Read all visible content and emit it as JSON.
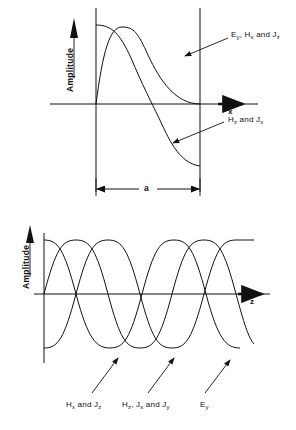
{
  "figure": {
    "background": "#ffffff",
    "stroke": "#111111"
  },
  "panels": [
    {
      "id": "transverse",
      "axis_y_label": "Amplitude",
      "axis_x_label": "x",
      "dimension_label": "a",
      "annotations": [
        {
          "id": "ann-ey",
          "text_html": "E<sub>y</sub>, H<sub>x</sub> and J<sub>z</sub>",
          "text": "Ey, Hx and Jz"
        },
        {
          "id": "ann-hz",
          "text_html": "H<sub>z</sub> and J<sub>x</sub>",
          "text": "Hz and Jx"
        }
      ]
    },
    {
      "id": "longitudinal",
      "axis_y_label": "Amplitude",
      "axis_x_label": "z",
      "annotations": [
        {
          "id": "ann-hx-jz",
          "text_html": "H<sub>x</sub> and J<sub>z</sub>",
          "text": "Hx and Jz"
        },
        {
          "id": "ann-hz-jx-jy",
          "text_html": "H<sub>z</sub>, J<sub>x</sub> and J<sub>y</sub>",
          "text": "Hz, Jx and Jy"
        },
        {
          "id": "ann-ey2",
          "text_html": "E<sub>y</sub>",
          "text": "Ey"
        }
      ]
    }
  ],
  "chart_data": [
    {
      "type": "line",
      "id": "transverse",
      "title": "",
      "xlabel": "x",
      "ylabel": "Amplitude",
      "xlim": [
        0,
        1
      ],
      "ylim": [
        -1.05,
        1.05
      ],
      "grid": false,
      "legend": "leader-lines",
      "annotations": [
        "Ey, Hx and Jz",
        "Hz and Jx",
        "a"
      ],
      "notes": "Transverse field variation of TE10 mode across guide width a. Walls drawn as vertical lines at x=0 and x=a. Dimension arrow labeled a below.",
      "series": [
        {
          "name": "Ey, Hx and Jz",
          "form": "sin(pi*x/a)",
          "x": [
            0,
            0.05,
            0.1,
            0.15,
            0.2,
            0.25,
            0.3,
            0.35,
            0.4,
            0.45,
            0.5,
            0.55,
            0.6,
            0.65,
            0.7,
            0.75,
            0.8,
            0.85,
            0.9,
            0.95,
            1
          ],
          "values": [
            0,
            0.156,
            0.309,
            0.454,
            0.588,
            0.707,
            0.809,
            0.891,
            0.951,
            0.988,
            1,
            0.988,
            0.951,
            0.891,
            0.809,
            0.707,
            0.588,
            0.454,
            0.309,
            0.156,
            0
          ]
        },
        {
          "name": "Hz and Jx",
          "form": "cos(pi*x/a)",
          "x": [
            0,
            0.05,
            0.1,
            0.15,
            0.2,
            0.25,
            0.3,
            0.35,
            0.4,
            0.45,
            0.5,
            0.55,
            0.6,
            0.65,
            0.7,
            0.75,
            0.8,
            0.85,
            0.9,
            0.95,
            1
          ],
          "values": [
            1,
            0.988,
            0.951,
            0.891,
            0.809,
            0.707,
            0.588,
            0.454,
            0.309,
            0.156,
            0,
            -0.156,
            -0.309,
            -0.454,
            -0.588,
            -0.707,
            -0.809,
            -0.891,
            -0.951,
            -0.988,
            -1
          ]
        }
      ]
    },
    {
      "type": "line",
      "id": "longitudinal",
      "title": "",
      "xlabel": "z",
      "ylabel": "Amplitude",
      "xlim": [
        0,
        1
      ],
      "ylim": [
        -1.05,
        1.05
      ],
      "grid": false,
      "legend": "leader-lines",
      "annotations": [
        "Hx and Jz",
        "Hz, Jx and Jy",
        "Ey"
      ],
      "notes": "Longitudinal variation along z over one guide wavelength; three sinusoids at differing phase.",
      "series": [
        {
          "name": "Hx and Jz",
          "form": "cos(2*pi*z)",
          "phase_deg": 0,
          "x": [
            0,
            0.05,
            0.1,
            0.15,
            0.2,
            0.25,
            0.3,
            0.35,
            0.4,
            0.45,
            0.5,
            0.55,
            0.6,
            0.65,
            0.7,
            0.75,
            0.8,
            0.85,
            0.9,
            0.95,
            1
          ],
          "values": [
            1,
            0.951,
            0.809,
            0.588,
            0.309,
            0,
            -0.309,
            -0.588,
            -0.809,
            -0.951,
            -1,
            -0.951,
            -0.809,
            -0.588,
            -0.309,
            0,
            0.309,
            0.588,
            0.809,
            0.951,
            1
          ]
        },
        {
          "name": "Hz, Jx and Jy",
          "form": "sin(2*pi*z)",
          "phase_deg": -90,
          "x": [
            0,
            0.05,
            0.1,
            0.15,
            0.2,
            0.25,
            0.3,
            0.35,
            0.4,
            0.45,
            0.5,
            0.55,
            0.6,
            0.65,
            0.7,
            0.75,
            0.8,
            0.85,
            0.9,
            0.95,
            1
          ],
          "values": [
            0,
            0.309,
            0.588,
            0.809,
            0.951,
            1,
            0.951,
            0.809,
            0.588,
            0.309,
            0,
            -0.309,
            -0.588,
            -0.809,
            -0.951,
            -1,
            -0.951,
            -0.809,
            -0.588,
            -0.309,
            0
          ]
        },
        {
          "name": "Ey",
          "form": "-sin(2*pi*z - pi/4)",
          "phase_deg": 135,
          "x": [
            0,
            0.05,
            0.1,
            0.15,
            0.2,
            0.25,
            0.3,
            0.35,
            0.4,
            0.45,
            0.5,
            0.55,
            0.6,
            0.65,
            0.7,
            0.75,
            0.8,
            0.85,
            0.9,
            0.95,
            1
          ],
          "values": [
            -1,
            -0.951,
            -0.809,
            -0.588,
            -0.309,
            0,
            0.309,
            0.588,
            0.809,
            0.951,
            1,
            0.951,
            0.809,
            0.588,
            0.309,
            0,
            -0.309,
            -0.588,
            -0.809,
            -0.951,
            -1
          ]
        }
      ]
    }
  ]
}
